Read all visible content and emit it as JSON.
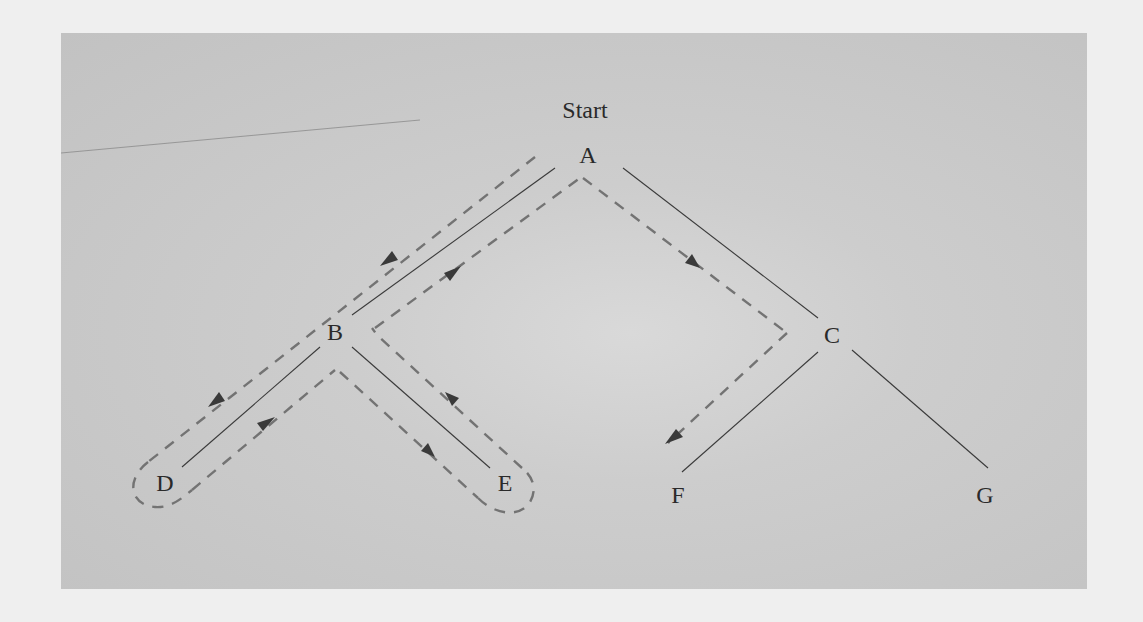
{
  "diagram": {
    "type": "tree-traversal",
    "start_label": "Start",
    "nodes": [
      {
        "id": "A",
        "label": "A",
        "x": 588,
        "y": 163
      },
      {
        "id": "B",
        "label": "B",
        "x": 335,
        "y": 340
      },
      {
        "id": "C",
        "label": "C",
        "x": 832,
        "y": 343
      },
      {
        "id": "D",
        "label": "D",
        "x": 165,
        "y": 491
      },
      {
        "id": "E",
        "label": "E",
        "x": 505,
        "y": 491
      },
      {
        "id": "F",
        "label": "F",
        "x": 678,
        "y": 503
      },
      {
        "id": "G",
        "label": "G",
        "x": 985,
        "y": 503
      }
    ],
    "edges": [
      {
        "from": "A",
        "to": "B"
      },
      {
        "from": "A",
        "to": "C"
      },
      {
        "from": "B",
        "to": "D"
      },
      {
        "from": "B",
        "to": "E"
      },
      {
        "from": "C",
        "to": "F"
      },
      {
        "from": "C",
        "to": "G"
      }
    ],
    "traversal_order": [
      "A",
      "B",
      "D",
      "B",
      "E",
      "B",
      "A",
      "C",
      "F"
    ],
    "colors": {
      "panel": "#c8c8c8",
      "page": "#efefef",
      "edge": "#3a3a3a",
      "dashed_path": "#737373",
      "text": "#2a2a2a"
    }
  }
}
